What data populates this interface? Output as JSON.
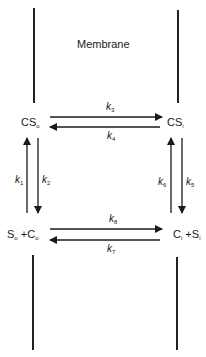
{
  "diagram": {
    "title": "Membrane",
    "states": {
      "cs_out": {
        "main": "CS",
        "sub": "o"
      },
      "cs_in": {
        "main": "CS",
        "sub": "i"
      },
      "free_out": {
        "s": "S",
        "s_sub": "o",
        "plus": "+",
        "c": "C",
        "c_sub": "o"
      },
      "free_in": {
        "c": "C",
        "c_sub": "i",
        "plus": "+",
        "s": "S",
        "s_sub": "i"
      }
    },
    "rate_constants": {
      "k1": {
        "k": "k",
        "sub": "1"
      },
      "k2": {
        "k": "k",
        "sub": "2"
      },
      "k3": {
        "k": "k",
        "sub": "3"
      },
      "k4": {
        "k": "k",
        "sub": "4"
      },
      "k5": {
        "k": "k",
        "sub": "5"
      },
      "k6": {
        "k": "k",
        "sub": "6"
      },
      "k7": {
        "k": "k",
        "sub": "7"
      },
      "k8": {
        "k": "k",
        "sub": "8"
      }
    },
    "transitions": [
      {
        "from": "CSo",
        "to": "CSi",
        "rate": "k3"
      },
      {
        "from": "CSi",
        "to": "CSo",
        "rate": "k4"
      },
      {
        "from": "So+Co",
        "to": "CSo",
        "rate": "k1"
      },
      {
        "from": "CSo",
        "to": "So+Co",
        "rate": "k2"
      },
      {
        "from": "CSi",
        "to": "Ci+Si",
        "rate": "k5"
      },
      {
        "from": "Ci+Si",
        "to": "CSi",
        "rate": "k6"
      },
      {
        "from": "So+Co",
        "to": "Ci+Si",
        "rate": "k8"
      },
      {
        "from": "Ci+Si",
        "to": "So+Co",
        "rate": "k7"
      }
    ],
    "colors": {
      "ink": "#1a1a1a"
    }
  }
}
